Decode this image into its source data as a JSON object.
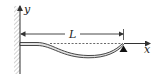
{
  "diagram": {
    "title": "",
    "labels": {
      "y_axis": "y",
      "x_axis": "x",
      "length": "L"
    },
    "elements": {
      "wall": "fixed-wall-hatched",
      "beam": "deflected-beam",
      "support": "pin-support-triangle",
      "reference_line": "dashed-undeflected-axis",
      "dimension": "length-dimension-arrow"
    },
    "colors": {
      "line": "#333333",
      "beam_fill": "#e0e0e0",
      "hatch": "#b0b0b0",
      "support": "#111111"
    }
  }
}
